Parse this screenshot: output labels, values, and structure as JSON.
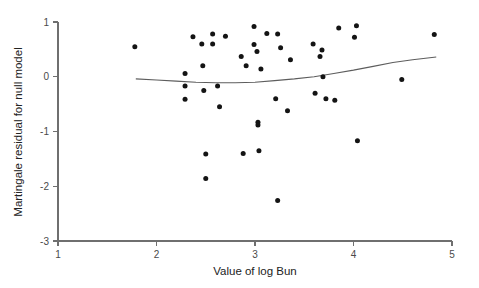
{
  "chart_data": {
    "type": "scatter",
    "title": "",
    "xlabel": "Value of log Bun",
    "ylabel": "Martingale residual for null model",
    "xlim": [
      1,
      5
    ],
    "ylim": [
      -3,
      1
    ],
    "xticks": [
      "1",
      "2",
      "3",
      "4",
      "5"
    ],
    "xtick_values": [
      1,
      2,
      3,
      4,
      5
    ],
    "yticks": [
      "1",
      "0",
      "-1",
      "-2",
      "-3"
    ],
    "ytick_values": [
      1,
      0,
      -1,
      -2,
      -3
    ],
    "grid": false,
    "legend": "none",
    "marker": "filled-circle",
    "marker_color": "#141414",
    "smoother_color": "#5d5d5d",
    "series": [
      {
        "name": "Martingale residuals",
        "points": [
          [
            1.78,
            0.55
          ],
          [
            2.29,
            0.06
          ],
          [
            2.29,
            -0.17
          ],
          [
            2.29,
            -0.41
          ],
          [
            2.37,
            0.73
          ],
          [
            2.46,
            0.6
          ],
          [
            2.47,
            0.2
          ],
          [
            2.48,
            -0.25
          ],
          [
            2.5,
            -1.41
          ],
          [
            2.5,
            -1.86
          ],
          [
            2.57,
            0.78
          ],
          [
            2.57,
            0.6
          ],
          [
            2.62,
            -0.17
          ],
          [
            2.64,
            -0.55
          ],
          [
            2.7,
            0.74
          ],
          [
            2.86,
            0.37
          ],
          [
            2.88,
            -1.4
          ],
          [
            2.91,
            0.2
          ],
          [
            2.99,
            0.92
          ],
          [
            2.99,
            0.59
          ],
          [
            3.02,
            0.46
          ],
          [
            3.03,
            -0.83
          ],
          [
            3.03,
            -0.88
          ],
          [
            3.04,
            -1.35
          ],
          [
            3.06,
            0.14
          ],
          [
            3.12,
            0.79
          ],
          [
            3.21,
            -0.4
          ],
          [
            3.23,
            0.78
          ],
          [
            3.23,
            -2.26
          ],
          [
            3.26,
            0.53
          ],
          [
            3.33,
            -0.62
          ],
          [
            3.36,
            0.31
          ],
          [
            3.59,
            0.6
          ],
          [
            3.61,
            -0.3
          ],
          [
            3.66,
            0.37
          ],
          [
            3.68,
            0.49
          ],
          [
            3.69,
            0.0
          ],
          [
            3.72,
            -0.4
          ],
          [
            3.81,
            -0.43
          ],
          [
            3.85,
            0.89
          ],
          [
            4.01,
            0.72
          ],
          [
            4.03,
            0.93
          ],
          [
            4.04,
            -1.17
          ],
          [
            4.49,
            -0.05
          ],
          [
            4.82,
            0.77
          ]
        ]
      }
    ],
    "smoother": {
      "name": "lowess-smoother",
      "points": [
        [
          1.79,
          -0.04
        ],
        [
          2.0,
          -0.06
        ],
        [
          2.2,
          -0.08
        ],
        [
          2.4,
          -0.1
        ],
        [
          2.6,
          -0.11
        ],
        [
          2.8,
          -0.11
        ],
        [
          3.0,
          -0.1
        ],
        [
          3.2,
          -0.07
        ],
        [
          3.4,
          -0.04
        ],
        [
          3.6,
          0.0
        ],
        [
          3.8,
          0.06
        ],
        [
          4.0,
          0.12
        ],
        [
          4.2,
          0.19
        ],
        [
          4.4,
          0.26
        ],
        [
          4.6,
          0.31
        ],
        [
          4.84,
          0.36
        ]
      ]
    }
  }
}
